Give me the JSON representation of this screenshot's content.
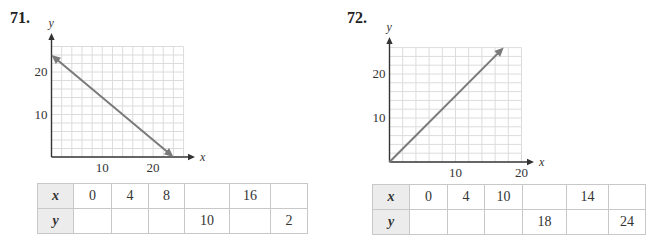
{
  "chart_data": [
    {
      "type": "line",
      "problem": "71.",
      "xlabel": "x",
      "ylabel": "y",
      "xlim": [
        0,
        26
      ],
      "ylim": [
        0,
        26
      ],
      "grid": true,
      "grid_step": 2,
      "xticks": [
        10,
        20
      ],
      "yticks": [
        10,
        20
      ],
      "series": [
        {
          "name": "line",
          "x": [
            0,
            24
          ],
          "y": [
            24,
            0
          ],
          "arrows": "both"
        }
      ],
      "table": {
        "row_labels": [
          "x",
          "y"
        ],
        "x": [
          "0",
          "4",
          "8",
          "",
          "16",
          ""
        ],
        "y": [
          "",
          "",
          "",
          "10",
          "",
          "2"
        ]
      }
    },
    {
      "type": "line",
      "problem": "72.",
      "xlabel": "x",
      "ylabel": "y",
      "xlim": [
        0,
        20
      ],
      "ylim": [
        0,
        26
      ],
      "grid": true,
      "grid_step": 2,
      "xticks": [
        10,
        20
      ],
      "yticks": [
        10,
        20
      ],
      "series": [
        {
          "name": "line",
          "x": [
            0,
            17.3
          ],
          "y": [
            0,
            26
          ],
          "arrows": "end"
        }
      ],
      "table": {
        "row_labels": [
          "x",
          "y"
        ],
        "x": [
          "0",
          "4",
          "10",
          "",
          "14",
          ""
        ],
        "y": [
          "",
          "",
          "",
          "18",
          "",
          "24"
        ]
      }
    }
  ],
  "colors": {
    "line": "#7a7a7a",
    "grid": "#dcdcdc",
    "axis": "#333333",
    "table_header_bg": "#ececec"
  }
}
